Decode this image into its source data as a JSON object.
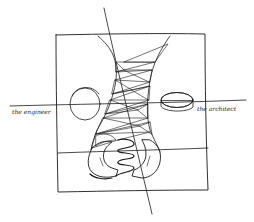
{
  "illustration": {
    "style": "hand-drawn pen sketch",
    "ink_color": "#1a1a1a",
    "background_color": "#ffffff",
    "labels": {
      "left": "the engineer",
      "right": "the architect"
    },
    "elements": [
      "square-frame",
      "diagonal-axis-line",
      "horizontal-axis-line",
      "lower-horizontal-line",
      "hourglass-form",
      "hatched-triangles",
      "dotted-triangles",
      "engineer-disc-hatched",
      "architect-disc-dotted",
      "clasped-hands"
    ]
  }
}
